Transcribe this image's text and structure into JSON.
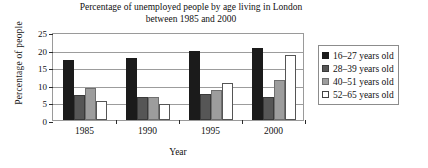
{
  "chart_data": {
    "type": "bar",
    "title": "Percentage of unemployed people by age living in London between 1985 and 2000",
    "title_line1": "Percentage of unemployed people by age living in London",
    "title_line2": "between 1985 and 2000",
    "xlabel": "Year",
    "ylabel": "Percentage of people",
    "categories": [
      "1985",
      "1990",
      "1995",
      "2000"
    ],
    "ylim": [
      0,
      25
    ],
    "yticks": [
      0,
      5,
      10,
      15,
      20,
      25
    ],
    "ytick_labels": [
      "0",
      "5",
      "10",
      "15",
      "20",
      "25"
    ],
    "grid": true,
    "legend_position": "right",
    "series": [
      {
        "name": "16–27 years old",
        "color": "#1b1b1b",
        "values": [
          17,
          17.5,
          19.5,
          20.5
        ]
      },
      {
        "name": "28–39 years old",
        "color": "#565656",
        "values": [
          7,
          6.5,
          7.5,
          6.5
        ]
      },
      {
        "name": "40–51 years old",
        "color": "#9d9d9d",
        "values": [
          9,
          6.5,
          8.5,
          11.5
        ]
      },
      {
        "name": "52–65 years old",
        "color": "#ffffff",
        "values": [
          5.5,
          4.5,
          10.5,
          18.5
        ]
      }
    ]
  }
}
